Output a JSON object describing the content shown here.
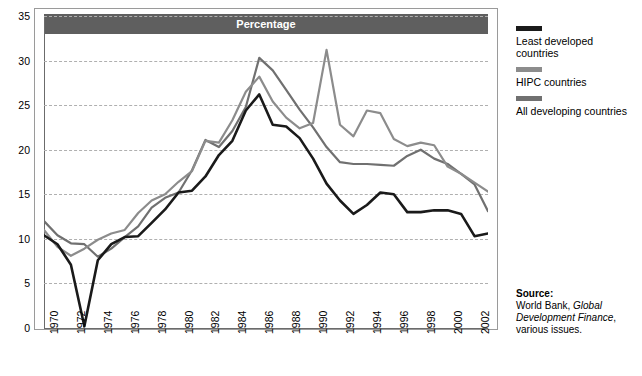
{
  "chart_data": {
    "type": "line",
    "title": "Percentage",
    "xlabel": "",
    "ylabel": "",
    "ylim": [
      0,
      35
    ],
    "yticks": [
      0,
      5,
      10,
      15,
      20,
      25,
      30,
      35
    ],
    "grid": true,
    "legend_position": "right",
    "x": [
      1970,
      1971,
      1972,
      1973,
      1974,
      1975,
      1976,
      1977,
      1978,
      1979,
      1980,
      1981,
      1982,
      1983,
      1984,
      1985,
      1986,
      1987,
      1988,
      1989,
      1990,
      1991,
      1992,
      1993,
      1994,
      1995,
      1996,
      1997,
      1998,
      1999,
      2000,
      2001,
      2002,
      2003
    ],
    "xtick_labels": [
      "1970",
      "1972",
      "1974",
      "1976",
      "1978",
      "1980",
      "1982",
      "1984",
      "1986",
      "1988",
      "1990",
      "1992",
      "1994",
      "1996",
      "1998",
      "2000",
      "2002"
    ],
    "series": [
      {
        "name": "Least developed countries",
        "color": "#1a1a1a",
        "values": [
          10.4,
          9.4,
          7.1,
          0.2,
          7.6,
          9.4,
          10.2,
          10.3,
          11.8,
          13.3,
          15.2,
          15.4,
          17.0,
          19.4,
          21.0,
          24.4,
          26.2,
          22.8,
          22.6,
          21.3,
          19.0,
          16.2,
          14.3,
          12.8,
          13.8,
          15.2,
          15.0,
          13.0,
          13.0,
          13.2,
          13.2,
          12.8,
          10.3,
          10.6
        ]
      },
      {
        "name": "HIPC countries",
        "color": "#8c8c8c",
        "values": [
          11.0,
          9.1,
          8.1,
          8.9,
          9.9,
          10.6,
          11.0,
          12.9,
          14.3,
          15.0,
          16.4,
          17.6,
          21.0,
          20.8,
          23.3,
          26.5,
          28.2,
          25.4,
          23.6,
          22.4,
          23.0,
          31.2,
          22.8,
          21.5,
          24.4,
          24.1,
          21.2,
          20.4,
          20.8,
          20.5,
          18.1,
          17.3,
          16.3,
          15.3
        ]
      },
      {
        "name": "All developing countries",
        "color": "#707070",
        "values": [
          12.0,
          10.4,
          9.5,
          9.4,
          8.0,
          8.9,
          10.2,
          11.4,
          13.5,
          14.6,
          15.2,
          17.7,
          21.1,
          20.3,
          22.1,
          24.8,
          30.3,
          28.9,
          26.7,
          24.5,
          22.5,
          20.3,
          18.6,
          18.4,
          18.4,
          18.3,
          18.2,
          19.3,
          20.0,
          19.0,
          18.4,
          17.3,
          16.1,
          13.1
        ]
      }
    ]
  },
  "legend": {
    "items": [
      {
        "label": "Least developed countries",
        "color": "#1a1a1a"
      },
      {
        "label": "HIPC countries",
        "color": "#8c8c8c"
      },
      {
        "label": "All developing countries",
        "color": "#707070"
      }
    ]
  },
  "source": {
    "heading": "Source:",
    "line1": "World Bank, ",
    "line1_em": "Global",
    "line2_em": "Development Finance",
    "line2_end": ",",
    "line3": "various issues."
  }
}
